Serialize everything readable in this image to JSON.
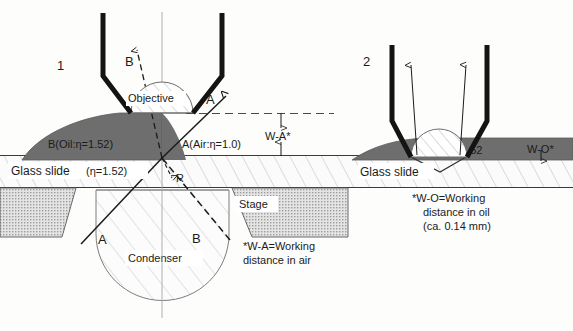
{
  "figure": {
    "title_absent": true,
    "panels": [
      {
        "number": "1",
        "name": "dry-objective-panel"
      },
      {
        "number": "2",
        "name": "oil-immersion-objective-panel"
      }
    ]
  },
  "colors": {
    "oil_fill": "#6e6e6e",
    "stage_fill": "#d9d9d9",
    "glass_fill": "#fbfbfb",
    "ink": "#1b1b1b",
    "barrel": "#141414",
    "hatch": "#9a9a9a"
  },
  "panel1": {
    "number": "1",
    "objective_label": "Objective",
    "oil_drop_label": "B(Oil:η=1.52)",
    "air_label": "A(Air:η=1.0)",
    "glass_slide_label": "Glass slide",
    "glass_slide_index": "(η=1.52)",
    "stage_label": "Stage",
    "condenser_label": "Condenser",
    "ray_b_top": "B",
    "ray_a_top": "A",
    "ray_a_bottom": "A",
    "ray_b_bottom": "B",
    "reflected_label": "R",
    "working_distance_label": "W-A*",
    "footnote_line1": "*W-A=Working",
    "footnote_line2": "distance in air"
  },
  "panel2": {
    "number": "2",
    "oil_label": "Oil:η=1.52",
    "working_distance_label": "W-O*",
    "glass_slide_label": "Glass slide",
    "footnote_line1": "*W-O=Working",
    "footnote_line2": "distance in oil",
    "footnote_line3": "(ca. 0.14 mm)"
  }
}
